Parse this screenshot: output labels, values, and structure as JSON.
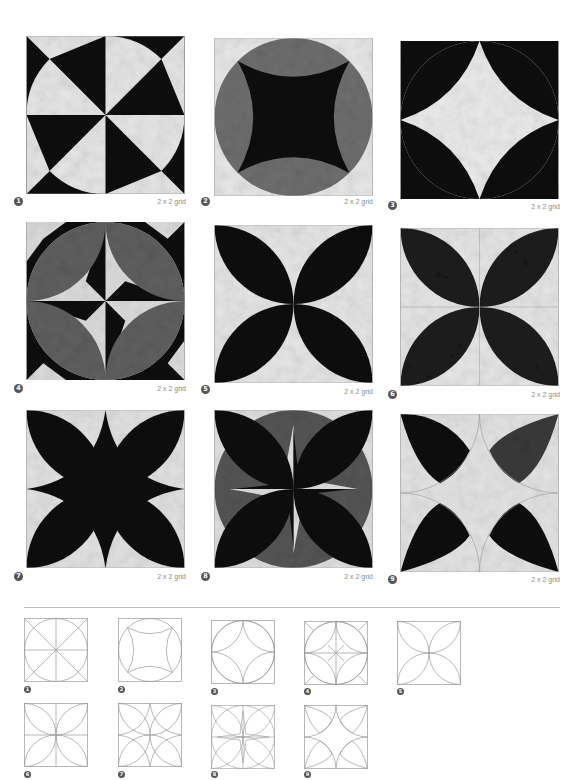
{
  "colors": {
    "dark": "#111111",
    "medium_gray": "#6e6e6e",
    "light": "#e6e6e6",
    "line": "#9a9a9a",
    "badge": "#555555",
    "label": "#8a8a8a"
  },
  "blocks": [
    {
      "number": "1",
      "grid_label": "2 x 2 grid",
      "design": "pinwheel-circle"
    },
    {
      "number": "2",
      "grid_label": "2 x 2 grid",
      "design": "circle-concave-square"
    },
    {
      "number": "3",
      "grid_label": "2 x 2 grid",
      "design": "circle-four-arcs-star"
    },
    {
      "number": "4",
      "grid_label": "2 x 2 grid",
      "design": "circle-petals-pinwheel"
    },
    {
      "number": "5",
      "grid_label": "2 x 2 grid",
      "design": "four-petals"
    },
    {
      "number": "6",
      "grid_label": "2 x 2 grid",
      "design": "four-petals-seamed"
    },
    {
      "number": "7",
      "grid_label": "2 x 2 grid",
      "design": "petals-star"
    },
    {
      "number": "8",
      "grid_label": "2 x 2 grid",
      "design": "circle-petals-star"
    },
    {
      "number": "9",
      "grid_label": "2 x 2 grid",
      "design": "half-petals-corners"
    }
  ],
  "diagrams": [
    {
      "number": "1"
    },
    {
      "number": "2"
    },
    {
      "number": "3"
    },
    {
      "number": "4"
    },
    {
      "number": "5"
    },
    {
      "number": "6"
    },
    {
      "number": "7"
    },
    {
      "number": "8"
    },
    {
      "number": "9"
    }
  ]
}
